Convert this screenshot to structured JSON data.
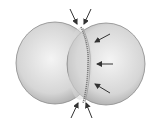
{
  "diagram": {
    "colors": {
      "background": "#ffffff",
      "cell_fill_light": "#f2f2f2",
      "cell_fill_mid": "#cfcfcf",
      "cell_fill_dark": "#a8a8a8",
      "outline": "#8a8a8a",
      "furrow": "#7a7a7a",
      "arrow": "#333333"
    },
    "arrows": [
      {
        "name": "top-left",
        "x1": 70,
        "y1": 9,
        "x2": 77,
        "y2": 24
      },
      {
        "name": "top-right",
        "x1": 91,
        "y1": 9,
        "x2": 84,
        "y2": 24
      },
      {
        "name": "right-upper",
        "x1": 110,
        "y1": 34,
        "x2": 95,
        "y2": 42
      },
      {
        "name": "right-middle",
        "x1": 113,
        "y1": 64,
        "x2": 97,
        "y2": 64
      },
      {
        "name": "right-lower",
        "x1": 110,
        "y1": 93,
        "x2": 95,
        "y2": 84
      },
      {
        "name": "bottom-left",
        "x1": 71,
        "y1": 118,
        "x2": 78,
        "y2": 103
      },
      {
        "name": "bottom-right",
        "x1": 92,
        "y1": 118,
        "x2": 86,
        "y2": 103
      }
    ]
  }
}
